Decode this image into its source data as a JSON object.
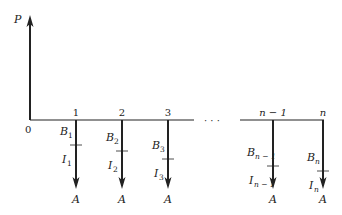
{
  "diagram": {
    "title_label": "P",
    "origin_label": "0",
    "ellipsis": "· · ·",
    "colors": {
      "line": "#222222",
      "background": "#ffffff"
    },
    "periods": [
      {
        "x": 76,
        "tick_label": "1",
        "b_main": "B",
        "b_sub": "1",
        "i_main": "I",
        "i_sub": "1",
        "a_label": "A",
        "tick_y": 145
      },
      {
        "x": 122,
        "tick_label": "2",
        "b_main": "B",
        "b_sub": "2",
        "i_main": "I",
        "i_sub": "2",
        "a_label": "A",
        "tick_y": 151
      },
      {
        "x": 168,
        "tick_label": "3",
        "b_main": "B",
        "b_sub": "3",
        "i_main": "I",
        "i_sub": "3",
        "a_label": "A",
        "tick_y": 159
      },
      {
        "x": 273,
        "tick_label": "n − 1",
        "b_main": "B",
        "b_sub": "n − 1",
        "i_main": "I",
        "i_sub": "n − 1",
        "a_label": "A",
        "tick_y": 166
      },
      {
        "x": 323,
        "tick_label": "n",
        "b_main": "B",
        "b_sub": "n",
        "i_main": "I",
        "i_sub": "n",
        "a_label": "A",
        "tick_y": 171
      }
    ]
  }
}
